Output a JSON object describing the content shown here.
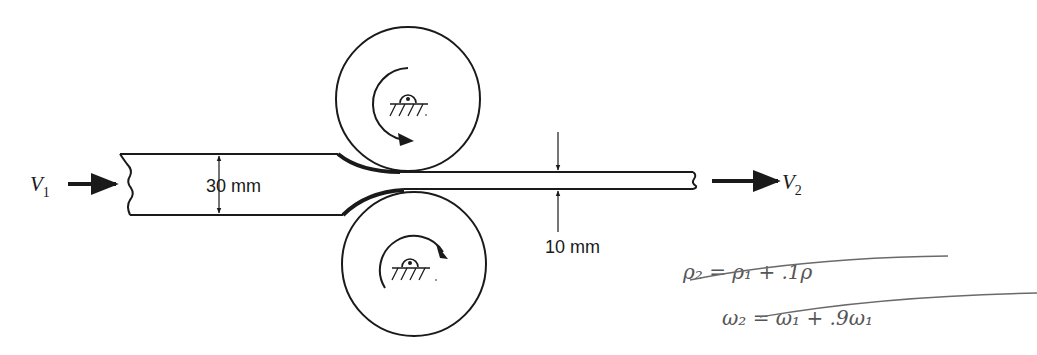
{
  "diagram": {
    "inlet": {
      "velocity_label": "V",
      "velocity_subscript": "1",
      "thickness_label": "30 mm"
    },
    "outlet": {
      "velocity_label": "V",
      "velocity_subscript": "2",
      "thickness_label": "10 mm"
    },
    "rolls": [
      {
        "name": "upper-roll",
        "rotation": "clockwise"
      },
      {
        "name": "lower-roll",
        "rotation": "counterclockwise"
      }
    ],
    "handwritten_notes": [
      "ρ₂ = ρ₁ + .1ρ",
      "ω₂ = ω₁ + .9ω₁"
    ],
    "colors": {
      "ink": "#1a1a1a",
      "pencil": "#6a6a6a",
      "background": "#ffffff"
    }
  }
}
